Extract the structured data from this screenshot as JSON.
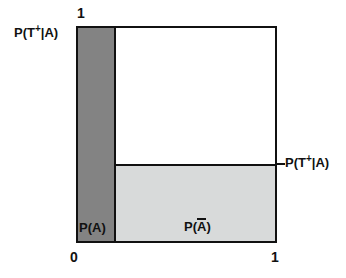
{
  "figure": {
    "background_color": "#ffffff",
    "box_border_color": "#111111"
  },
  "chart_data": {
    "type": "bar",
    "subtype": "mosaic-unit-square",
    "title": "",
    "xlabel": "",
    "ylabel": "",
    "xlim": [
      0,
      1
    ],
    "ylim": [
      0,
      1
    ],
    "grid": false,
    "legend": false,
    "x_tick_labels": [
      "0",
      "1"
    ],
    "x_tick_values": [
      0,
      1
    ],
    "y_tick_labels": [
      "1"
    ],
    "y_tick_values": [
      1
    ],
    "categories": [
      "P(A)",
      "P(A-bar)"
    ],
    "category_widths": [
      0.19,
      0.81
    ],
    "series": [
      {
        "name": "P(T+|A)",
        "values": [
          1.0,
          0.37
        ],
        "fill_colors": [
          "#838383",
          "#d8dada"
        ]
      }
    ],
    "regions": [
      {
        "name": "P(A) band",
        "label": "P(A)",
        "x_range": [
          0.0,
          0.19
        ],
        "y_range": [
          0.0,
          1.0
        ],
        "color": "#838383"
      },
      {
        "name": "P(A-bar) positive-test band",
        "label": "P(Ā)",
        "x_range": [
          0.19,
          1.0
        ],
        "y_range": [
          0.0,
          0.37
        ],
        "color": "#d8dada"
      },
      {
        "name": "P(A-bar) negative-test band",
        "label": "",
        "x_range": [
          0.19,
          1.0
        ],
        "y_range": [
          0.37,
          1.0
        ],
        "color": "#ffffff"
      }
    ],
    "annotations": [
      {
        "text": "P(T+|A)",
        "position": "left-top",
        "value": 1.0
      },
      {
        "text": "P(T+|A)",
        "position": "right-middle",
        "value": 0.37
      },
      {
        "text": "P(A)",
        "position": "inside-bottom-left"
      },
      {
        "text": "P(A-bar)",
        "position": "inside-bottom-center"
      }
    ]
  },
  "labels": {
    "left_top": {
      "prefix": "P(T",
      "sup": "+",
      "mid": "|",
      "arg": "A",
      "suffix": ")"
    },
    "right_mid": {
      "prefix": "P(T",
      "sup": "+",
      "mid": "|",
      "arg": "A",
      "suffix": ")"
    },
    "area_pa": "P(A)",
    "area_pnota": {
      "prefix": "P(",
      "arg": "A",
      "suffix": ")"
    }
  },
  "ticks": {
    "top_y_1": "1",
    "x_0": "0",
    "x_1": "1"
  }
}
